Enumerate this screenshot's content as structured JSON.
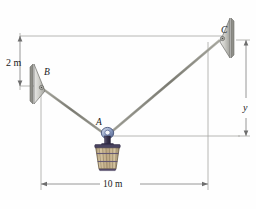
{
  "figure": {
    "kind": "statics-free-body-diagram",
    "background_color": "#fefefe",
    "labels": {
      "point_a": "A",
      "point_b": "B",
      "point_c": "C",
      "height_2m": "2 m",
      "span_10m": "10 m",
      "height_y": "y"
    },
    "colors": {
      "cable": "#8d8d84",
      "dimension_line": "#8c8c8c",
      "bracket_fill": "#c9c9c4",
      "bracket_edge": "#6f6f6a",
      "ring_blue": "#5a6f9e",
      "basket_body": "#b9a37e",
      "basket_dark": "#4a4460",
      "text": "#1a1a1a"
    },
    "geometry": {
      "point_a": {
        "x": 107,
        "y": 137
      },
      "point_b": {
        "x": 41,
        "y": 86
      },
      "point_c": {
        "x": 222,
        "y": 37
      },
      "top_reference_line_y": 36,
      "a_level_line_y": 136,
      "baseline_dimension_y": 184,
      "left_extension_x": 20,
      "right_extension_x": 208,
      "y_dimension_x": 246
    },
    "annotations": [
      {
        "name": "vertical-dimension-2m",
        "value": "2 m",
        "from": "top reference line",
        "to": "bracket B"
      },
      {
        "name": "horizontal-dimension-10m",
        "value": "10 m",
        "from": "B vertical",
        "to": "C vertical"
      },
      {
        "name": "vertical-dimension-y",
        "value": "y",
        "from": "point C level",
        "to": "point A level"
      }
    ]
  }
}
